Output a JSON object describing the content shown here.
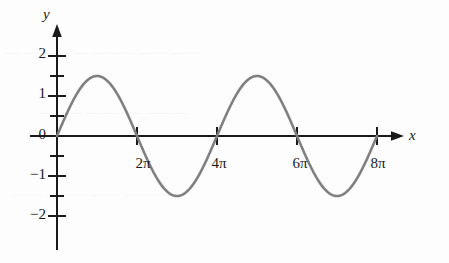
{
  "chart_data": {
    "type": "line",
    "title": "",
    "subtitle": "",
    "xlabel": "x",
    "ylabel": "y",
    "grid": false,
    "legend": null,
    "curve_color": "#808080",
    "axis_color": "#1a1a1a",
    "xlim": [
      -0.4,
      9.6
    ],
    "ylim": [
      -2.55,
      2.6
    ],
    "x_unit": "pi",
    "x_tick_labels": [
      "2π",
      "4π",
      "6π",
      "8π"
    ],
    "x_tick_values": [
      2,
      4,
      6,
      8
    ],
    "y_tick_labels": [
      "2",
      "1",
      "0",
      "−1",
      "−2"
    ],
    "y_tick_values": [
      2,
      1,
      0,
      -1,
      -2
    ],
    "y_minor_tick_values": [
      2.5,
      1.5,
      0.5,
      -0.5,
      -1.5,
      -2.5
    ],
    "amplitude": 1.5,
    "series": [
      {
        "name": "y = 1.5 sin(x/2)",
        "x": [
          0,
          0.5,
          1,
          1.5,
          2,
          2.5,
          3,
          3.5,
          4,
          4.5,
          5,
          5.5,
          6,
          6.5,
          7,
          7.5,
          8
        ],
        "y": [
          0,
          -0.574,
          -1.061,
          -1.386,
          -1.5,
          -1.386,
          -1.061,
          -0.574,
          0,
          0.574,
          1.061,
          1.386,
          1.5,
          1.386,
          1.061,
          0.574,
          0
        ]
      }
    ],
    "annotations": {
      "minimum": {
        "x": 2,
        "y": -1.5,
        "x_label": "2π"
      },
      "zero_crossing": {
        "x": 4,
        "y": 0,
        "x_label": "4π"
      },
      "maximum": {
        "x": 6,
        "y": 1.5,
        "x_label": "6π"
      },
      "end_point": {
        "x": 8,
        "y": 0,
        "x_label": "8π"
      }
    }
  },
  "axes": {
    "y_name": "y",
    "x_name": "x"
  },
  "y_ticks": [
    {
      "label": "2"
    },
    {
      "label": "1"
    },
    {
      "label": "0"
    },
    {
      "label": "−1"
    },
    {
      "label": "−2"
    }
  ],
  "x_ticks": [
    {
      "label": "2π"
    },
    {
      "label": "4π"
    },
    {
      "label": "6π"
    },
    {
      "label": "8π"
    }
  ],
  "artifacts": {
    "line1": "— —  —— — ———  —— ——",
    "line2": "———  ————  ———",
    "line3": "—— ——— ——  ————"
  }
}
